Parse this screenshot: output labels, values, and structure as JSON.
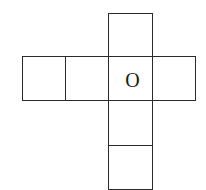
{
  "diagram": {
    "line_color": "#2a2a2a",
    "cells": [
      {
        "id": "top",
        "row": 0,
        "col": 2,
        "label": ""
      },
      {
        "id": "row-1",
        "row": 1,
        "col": 0,
        "label": ""
      },
      {
        "id": "row-2",
        "row": 1,
        "col": 1,
        "label": ""
      },
      {
        "id": "row-3",
        "row": 1,
        "col": 2,
        "label": "O"
      },
      {
        "id": "row-4",
        "row": 1,
        "col": 3,
        "label": ""
      },
      {
        "id": "below-1",
        "row": 2,
        "col": 2,
        "label": ""
      },
      {
        "id": "below-2",
        "row": 3,
        "col": 2,
        "label": ""
      }
    ]
  }
}
